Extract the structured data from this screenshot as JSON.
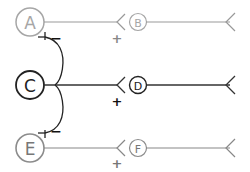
{
  "neurons": {
    "A": {
      "label": "A",
      "color": "#a6a6a6"
    },
    "B": {
      "label": "B",
      "color": "#a6a6a6"
    },
    "C": {
      "label": "C",
      "color": "#222222"
    },
    "D": {
      "label": "D",
      "color": "#222222"
    },
    "E": {
      "label": "E",
      "color": "#8c8c8c"
    },
    "F": {
      "label": "F",
      "color": "#8c8c8c"
    }
  },
  "signs": {
    "ab_plus": "+",
    "cd_plus": "+",
    "ef_plus": "+",
    "ca_minus": "−",
    "ce_minus": "−"
  }
}
